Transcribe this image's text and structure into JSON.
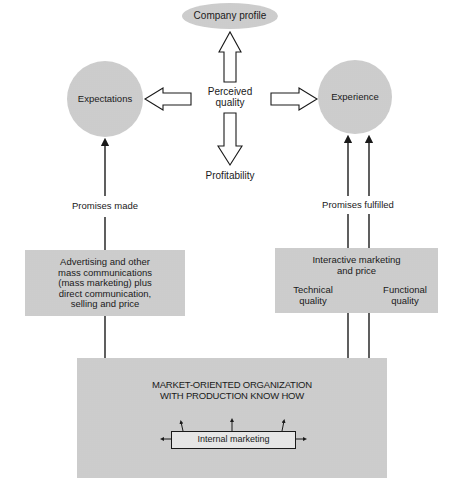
{
  "diagram": {
    "nodes": {
      "company_profile": "Company profile",
      "perceived_quality_line1": "Perceived",
      "perceived_quality_line2": "quality",
      "expectations": "Expectations",
      "experience": "Experience",
      "profitability": "Profitability",
      "promises_made": "Promises made",
      "promises_fulfilled": "Promises fulfilled",
      "advertising_box": {
        "lines": [
          "Advertising and other",
          "mass communications",
          "(mass marketing) plus",
          "direct communication,",
          "selling and price"
        ]
      },
      "interactive_box": {
        "title_lines": [
          "Interactive marketing",
          "and price"
        ],
        "technical_quality_lines": [
          "Technical",
          "quality"
        ],
        "functional_quality_lines": [
          "Functional",
          "quality"
        ]
      },
      "organization_box": {
        "title_lines": [
          "MARKET-ORIENTED ORGANIZATION",
          "WITH PRODUCTION KNOW HOW"
        ],
        "internal_marketing": "Internal marketing"
      }
    },
    "colors": {
      "fill_gray": "#dcdcdc",
      "line": "#1a1a1a",
      "background": "#ffffff"
    }
  }
}
